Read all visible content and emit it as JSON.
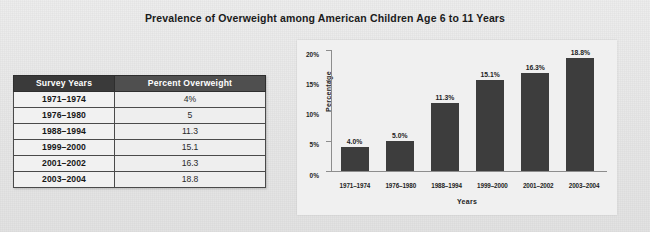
{
  "figure": {
    "title": "Prevalence of Overweight among American Children Age 6 to 11 Years"
  },
  "table": {
    "name": "prevalence-table",
    "columns": [
      "Survey Years",
      "Percent Overweight"
    ],
    "rows": [
      {
        "years": "1971–1974",
        "percent": "4%"
      },
      {
        "years": "1976–1980",
        "percent": "5"
      },
      {
        "years": "1988–1994",
        "percent": "11.3"
      },
      {
        "years": "1999–2000",
        "percent": "15.1"
      },
      {
        "years": "2001–2002",
        "percent": "16.3"
      },
      {
        "years": "2003–2004",
        "percent": "18.8"
      }
    ]
  },
  "chart_data": {
    "type": "bar",
    "title": "",
    "categories": [
      "1971–1974",
      "1976–1980",
      "1988–1994",
      "1999–2000",
      "2001–2002",
      "2003–2004"
    ],
    "values": [
      4.0,
      5.0,
      11.3,
      15.1,
      16.3,
      18.8
    ],
    "data_labels": [
      "4.0%",
      "5.0%",
      "11.3%",
      "15.1%",
      "16.3%",
      "18.8%"
    ],
    "xlabel": "Years",
    "ylabel": "Percentage",
    "ylim": [
      0,
      20
    ],
    "yticks": [
      0,
      5,
      10,
      15,
      20
    ],
    "ytick_labels": [
      "0%",
      "5%",
      "10%",
      "15%",
      "20%"
    ],
    "grid": false,
    "legend": false,
    "bar_color": "#3d3d3d",
    "panel_background": "#f0f0f0"
  },
  "colors": {
    "page_background": "#e9e9e9",
    "header_years_fill": "#3a3a3a",
    "header_percent_fill": "#4f4f4f",
    "header_text": "#ffffff",
    "table_border": "#4a4a4a",
    "bar": "#3d3d3d",
    "axis": "#8d8d8d",
    "text": "#1b1b1b"
  }
}
